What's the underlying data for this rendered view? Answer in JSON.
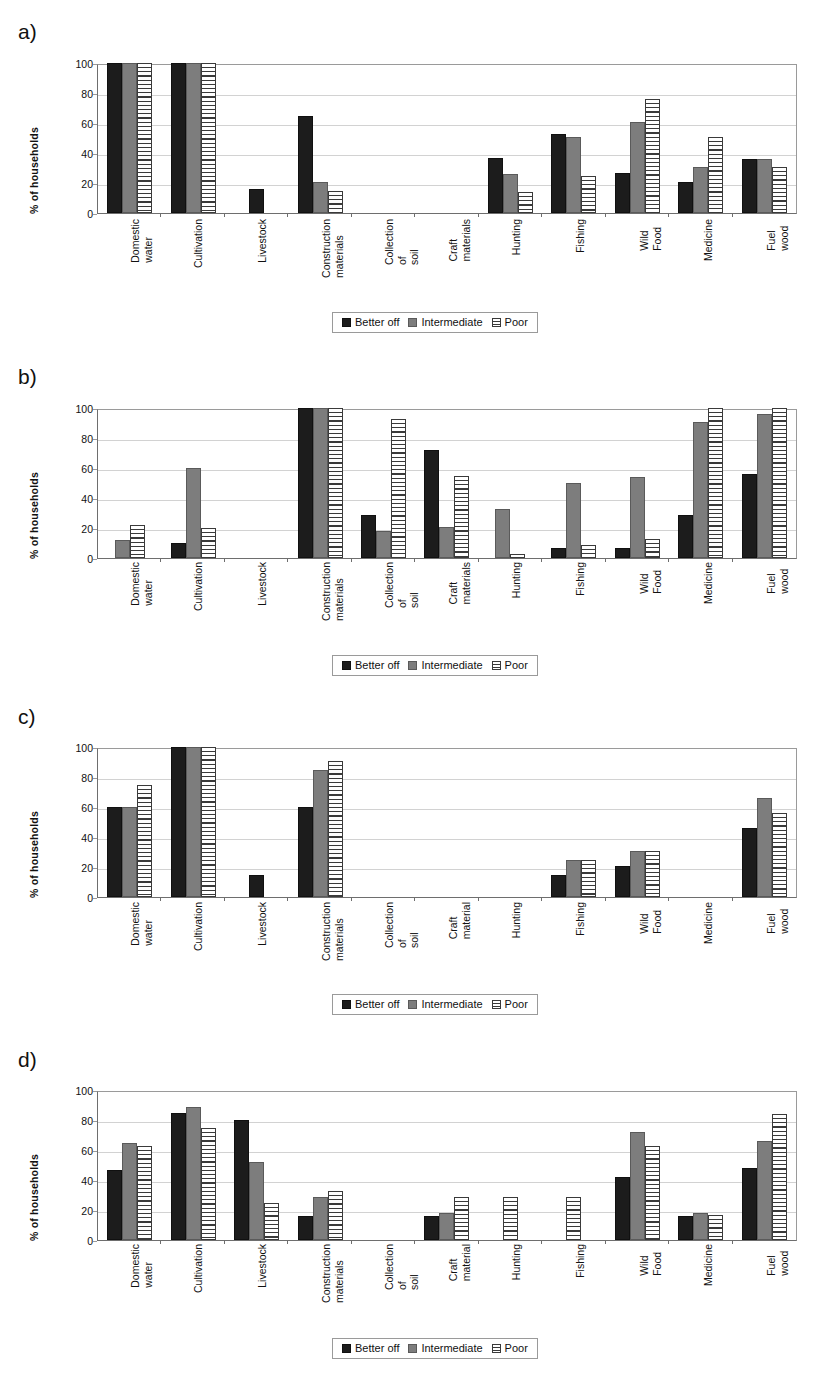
{
  "figure": {
    "ylabel": "% of households",
    "yticks": [
      "0",
      "20",
      "40",
      "60",
      "80",
      "100"
    ],
    "legend": {
      "better_off": "Better off",
      "intermediate": "Intermediate",
      "poor": "Poor"
    },
    "colors": {
      "better_off": "#1c1c1c",
      "intermediate": "#7d7d7d",
      "poor": "#ffffff",
      "poor_hatch": "#3a3a3a",
      "grid": "#d2d2d2",
      "axis": "#6e6e6e"
    }
  },
  "panels": [
    {
      "letter": "a)"
    },
    {
      "letter": "b)"
    },
    {
      "letter": "c)"
    },
    {
      "letter": "d)"
    }
  ],
  "chart_data": [
    {
      "type": "bar",
      "title": "a)",
      "xlabel": "",
      "ylabel": "% of households",
      "ylim": [
        0,
        100
      ],
      "yticks": [
        0,
        20,
        40,
        60,
        80,
        100
      ],
      "grid": true,
      "legend_position": "bottom",
      "categories": [
        "Domestic\nwater",
        "Cultivation",
        "Livestock",
        "Construction\nmaterials",
        "Collection of\nsoil",
        "Craft\nmaterials",
        "Hunting",
        "Fishing",
        "Wild Food",
        "Medicine",
        "Fuel wood"
      ],
      "series": [
        {
          "name": "Better off",
          "values": [
            100,
            100,
            16,
            65,
            0,
            0,
            37,
            53,
            27,
            21,
            36
          ]
        },
        {
          "name": "Intermediate",
          "values": [
            100,
            100,
            0,
            21,
            0,
            0,
            26,
            51,
            61,
            31,
            36
          ]
        },
        {
          "name": "Poor",
          "values": [
            100,
            100,
            0,
            15,
            0,
            0,
            14,
            25,
            76,
            51,
            31
          ]
        }
      ]
    },
    {
      "type": "bar",
      "title": "b)",
      "xlabel": "",
      "ylabel": "% of households",
      "ylim": [
        0,
        100
      ],
      "yticks": [
        0,
        20,
        40,
        60,
        80,
        100
      ],
      "grid": true,
      "legend_position": "bottom",
      "categories": [
        "Domestic\nwater",
        "Cultivation",
        "Livestock",
        "Construction\nmaterials",
        "Collection of\nsoil",
        "Craft\nmaterials",
        "Hunting",
        "Fishing",
        "Wild Food",
        "Medicine",
        "Fuel wood"
      ],
      "series": [
        {
          "name": "Better off",
          "values": [
            0,
            10,
            0,
            100,
            29,
            72,
            0,
            7,
            7,
            29,
            56
          ]
        },
        {
          "name": "Intermediate",
          "values": [
            12,
            60,
            0,
            100,
            18,
            21,
            33,
            50,
            54,
            91,
            96
          ]
        },
        {
          "name": "Poor",
          "values": [
            22,
            20,
            0,
            100,
            93,
            55,
            3,
            9,
            13,
            100,
            100
          ]
        }
      ]
    },
    {
      "type": "bar",
      "title": "c)",
      "xlabel": "",
      "ylabel": "% of households",
      "ylim": [
        0,
        100
      ],
      "yticks": [
        0,
        20,
        40,
        60,
        80,
        100
      ],
      "grid": true,
      "legend_position": "bottom",
      "categories": [
        "Domestic\nwater",
        "Cultivation",
        "Livestock",
        "Construction\nmaterials",
        "Collection of\nsoil",
        "Craft\nmaterial",
        "Hunting",
        "Fishing",
        "Wild Food",
        "Medicine",
        "Fuel wood"
      ],
      "series": [
        {
          "name": "Better off",
          "values": [
            60,
            100,
            15,
            60,
            0,
            0,
            0,
            15,
            21,
            0,
            46
          ]
        },
        {
          "name": "Intermediate",
          "values": [
            60,
            100,
            0,
            85,
            0,
            0,
            0,
            25,
            31,
            0,
            66
          ]
        },
        {
          "name": "Poor",
          "values": [
            75,
            100,
            0,
            91,
            0,
            0,
            0,
            25,
            31,
            0,
            56
          ]
        }
      ]
    },
    {
      "type": "bar",
      "title": "d)",
      "xlabel": "",
      "ylabel": "% of households",
      "ylim": [
        0,
        100
      ],
      "yticks": [
        0,
        20,
        40,
        60,
        80,
        100
      ],
      "grid": true,
      "legend_position": "bottom",
      "categories": [
        "Domestic\nwater",
        "Cultivation",
        "Livestock",
        "Construction\nmaterials",
        "Collection of\nsoil",
        "Craft\nmaterial",
        "Hunting",
        "Fishing",
        "Wild Food",
        "Medicine",
        "Fuel wood"
      ],
      "series": [
        {
          "name": "Better off",
          "values": [
            47,
            85,
            80,
            16,
            0,
            16,
            0,
            0,
            42,
            16,
            48
          ]
        },
        {
          "name": "Intermediate",
          "values": [
            65,
            89,
            52,
            29,
            0,
            18,
            0,
            0,
            72,
            18,
            66
          ]
        },
        {
          "name": "Poor",
          "values": [
            63,
            75,
            25,
            33,
            0,
            29,
            29,
            29,
            63,
            17,
            84
          ]
        }
      ]
    }
  ]
}
